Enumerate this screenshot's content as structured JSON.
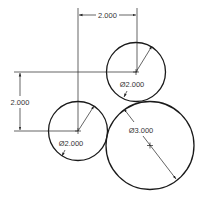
{
  "drawing": {
    "title": "Three tangent circles with dimensions",
    "colors": {
      "line": "#1a1a1a",
      "thin": "#222222",
      "text": "#333333",
      "background": "#ffffff"
    },
    "dimensions": {
      "horizontal": {
        "label": "2.000"
      },
      "vertical": {
        "label": "2.000"
      }
    },
    "circles": [
      {
        "id": "upper",
        "diameter_label": "Ø2.000"
      },
      {
        "id": "lower-left",
        "diameter_label": "Ø2.000"
      },
      {
        "id": "large",
        "diameter_label": "Ø3.000"
      }
    ]
  }
}
